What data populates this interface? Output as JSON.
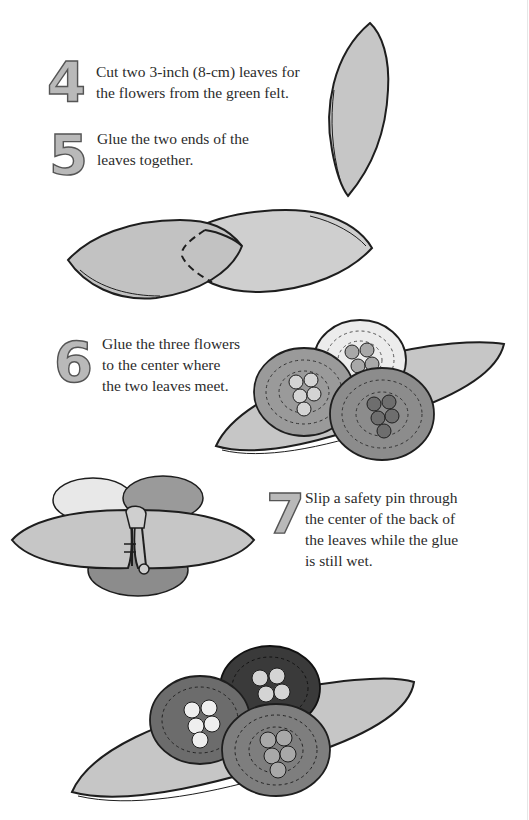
{
  "steps": [
    {
      "number": "4",
      "lines": [
        "Cut two 3-inch (8-cm) leaves for",
        "the flowers from the green felt."
      ]
    },
    {
      "number": "5",
      "lines": [
        "Glue the two ends of the",
        "leaves together."
      ]
    },
    {
      "number": "6",
      "lines": [
        "Glue the three flowers",
        "to the center where",
        "the two leaves meet."
      ]
    },
    {
      "number": "7",
      "lines": [
        "Slip a safety pin through",
        "the center of the back of",
        "the leaves while the glue",
        "is still wet."
      ]
    }
  ],
  "illustrations": {
    "single_leaf": "felt-leaf",
    "overlapping_leaves": "two-leaves-glued-ends",
    "flowers_on_leaves": "three-coiled-flowers-on-leaves",
    "safety_pin_back": "safety-pin-on-back",
    "finished_pin": "finished-flower-pin"
  },
  "colors": {
    "felt": "#c4c4c4",
    "outline": "#1e1e1e",
    "number_fill": "#b9b9b9",
    "flower_light": "#d8d8d8",
    "flower_mid": "#8a8a8a",
    "flower_dark": "#3c3c3c"
  }
}
